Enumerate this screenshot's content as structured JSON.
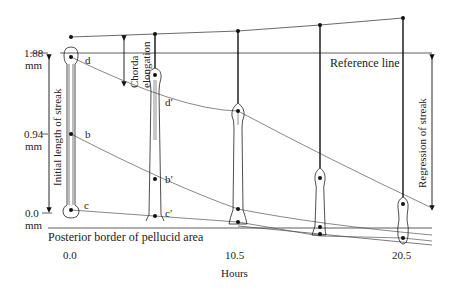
{
  "diagram": {
    "y_axis": {
      "title": "Initial length of streak",
      "ticks": [
        {
          "value": "1.88",
          "unit": "mm"
        },
        {
          "value": "0.94",
          "unit": "mm"
        },
        {
          "value": "0.0",
          "unit": "mm"
        }
      ]
    },
    "x_axis": {
      "title": "Hours",
      "ticks": [
        "0.0",
        "10.5",
        "20.5"
      ]
    },
    "labels": {
      "reference_line": "Reference line",
      "posterior_border": "Posterior border of pellucid area",
      "chorda_line1": "Chorda",
      "chorda_line2": "elongation",
      "regression": "Regression of streak"
    },
    "points": {
      "d": "d",
      "b": "b",
      "c": "c",
      "d_prime": "d′",
      "b_prime": "b′",
      "c_prime": "c′"
    },
    "stages_hours": [
      0.0,
      5.25,
      10.5,
      15.5,
      20.5
    ]
  }
}
